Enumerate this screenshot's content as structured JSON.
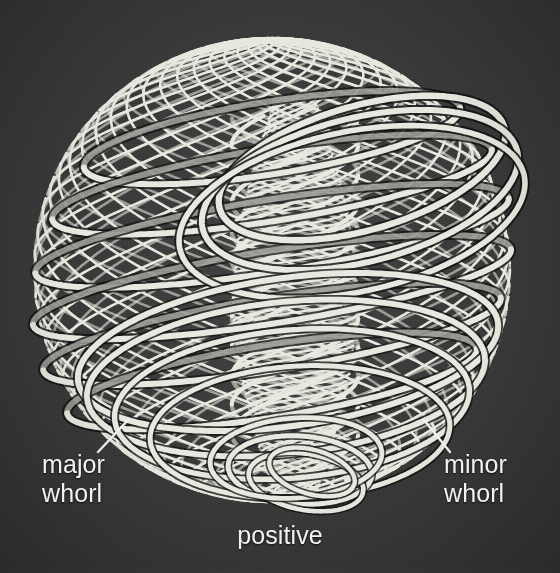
{
  "figure": {
    "kind": "wireframe-diagram",
    "background_color": "#3a3a3a",
    "strand_color": "#e9e8e0",
    "shadow_color": "#121212",
    "label_color": "#f2f2ee",
    "width": 560,
    "height": 573
  },
  "labels": {
    "major_whorl": "major\nwhorl",
    "minor_whorl": "minor\nwhorl",
    "positive": "positive"
  },
  "leaders": [
    {
      "name": "major-whorl-leader",
      "x1": 98,
      "y1": 452,
      "x2": 128,
      "y2": 420
    },
    {
      "name": "minor-whorl-leader",
      "x1": 450,
      "y1": 452,
      "x2": 424,
      "y2": 420
    }
  ],
  "geometry": {
    "center_x": 272,
    "center_y": 270,
    "radius_x": 238,
    "radius_y": 232,
    "major_whorl": {
      "description": "thick bright bands looping around the sphere, tilted, 4 visible sweeps",
      "stroke_width": 6.0,
      "count": 9,
      "tilt_deg": -9,
      "ring_ry": 66
    },
    "minor_whorl": {
      "description": "fine dense helical lattice strands covering the sphere surface",
      "stroke_width": 2.6,
      "count": 26,
      "turns": 1
    },
    "central_column": {
      "description": "vertical core where strands bundle through the sphere axis",
      "x": 295,
      "half_width": 62,
      "top": 96,
      "bottom": 500
    }
  }
}
